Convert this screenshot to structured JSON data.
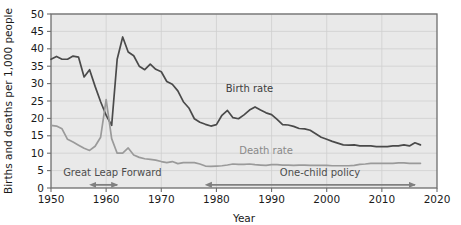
{
  "chart_data": {
    "type": "line",
    "title": "",
    "xlabel": "Year",
    "ylabel": "Births and deaths per 1,000 people",
    "xlim": [
      1950,
      2020
    ],
    "ylim": [
      0,
      50
    ],
    "xticks": [
      1950,
      1960,
      1970,
      1980,
      1990,
      2000,
      2010,
      2020
    ],
    "yticks": [
      0,
      5,
      10,
      15,
      20,
      25,
      30,
      35,
      40,
      45,
      50
    ],
    "grid": true,
    "legend_position": "inline-labels",
    "colors": {
      "birth_rate": "#4a4a4a",
      "death_rate": "#9a9a9a",
      "plot_background": "#e9e9e9",
      "grid": "#cfcfcf",
      "axis": "#6e6e6e",
      "annotation": "#808080"
    },
    "series": [
      {
        "name": "Birth rate",
        "color": "#4a4a4a",
        "label_x": 1986,
        "label_y": 27.5,
        "x": [
          1950,
          1951,
          1952,
          1953,
          1954,
          1955,
          1956,
          1957,
          1958,
          1959,
          1960,
          1961,
          1962,
          1963,
          1964,
          1965,
          1966,
          1967,
          1968,
          1969,
          1970,
          1971,
          1972,
          1973,
          1974,
          1975,
          1976,
          1977,
          1978,
          1979,
          1980,
          1981,
          1982,
          1983,
          1984,
          1985,
          1986,
          1987,
          1988,
          1989,
          1990,
          1991,
          1992,
          1993,
          1994,
          1995,
          1996,
          1997,
          1998,
          1999,
          2000,
          2001,
          2002,
          2003,
          2004,
          2005,
          2006,
          2007,
          2008,
          2009,
          2010,
          2011,
          2012,
          2013,
          2014,
          2015,
          2016,
          2017
        ],
        "values": [
          37.0,
          37.8,
          37.0,
          37.0,
          37.9,
          37.6,
          31.9,
          34.0,
          29.2,
          24.8,
          20.9,
          18.0,
          37.0,
          43.4,
          39.1,
          38.0,
          35.0,
          34.0,
          35.6,
          34.1,
          33.4,
          30.6,
          29.8,
          27.9,
          24.8,
          23.0,
          19.9,
          18.9,
          18.3,
          17.8,
          18.2,
          20.9,
          22.3,
          20.2,
          19.9,
          21.0,
          22.4,
          23.3,
          22.4,
          21.6,
          21.1,
          19.7,
          18.2,
          18.1,
          17.7,
          17.1,
          17.0,
          16.6,
          15.6,
          14.6,
          14.0,
          13.4,
          12.9,
          12.4,
          12.3,
          12.4,
          12.1,
          12.1,
          12.1,
          11.9,
          11.9,
          11.9,
          12.1,
          12.1,
          12.4,
          12.1,
          13.0,
          12.4
        ]
      },
      {
        "name": "Death rate",
        "color": "#9a9a9a",
        "label_x": 1989,
        "label_y": 9.8,
        "x": [
          1950,
          1951,
          1952,
          1953,
          1954,
          1955,
          1956,
          1957,
          1958,
          1959,
          1960,
          1961,
          1962,
          1963,
          1964,
          1965,
          1966,
          1967,
          1968,
          1969,
          1970,
          1971,
          1972,
          1973,
          1974,
          1975,
          1976,
          1977,
          1978,
          1979,
          1980,
          1981,
          1982,
          1983,
          1984,
          1985,
          1986,
          1987,
          1988,
          1989,
          1990,
          1991,
          1992,
          1993,
          1994,
          1995,
          1996,
          1997,
          1998,
          1999,
          2000,
          2001,
          2002,
          2003,
          2004,
          2005,
          2006,
          2007,
          2008,
          2009,
          2010,
          2011,
          2012,
          2013,
          2014,
          2015,
          2016,
          2017
        ],
        "values": [
          18.0,
          17.8,
          17.0,
          14.0,
          13.2,
          12.3,
          11.4,
          10.8,
          12.0,
          14.6,
          25.4,
          14.2,
          10.0,
          10.0,
          11.5,
          9.5,
          8.8,
          8.4,
          8.2,
          8.0,
          7.6,
          7.3,
          7.6,
          7.0,
          7.3,
          7.3,
          7.3,
          6.9,
          6.3,
          6.2,
          6.3,
          6.4,
          6.6,
          6.9,
          6.8,
          6.8,
          6.9,
          6.7,
          6.6,
          6.5,
          6.7,
          6.7,
          6.6,
          6.6,
          6.5,
          6.6,
          6.6,
          6.5,
          6.5,
          6.5,
          6.5,
          6.4,
          6.4,
          6.4,
          6.4,
          6.5,
          6.8,
          6.9,
          7.1,
          7.1,
          7.1,
          7.1,
          7.1,
          7.2,
          7.2,
          7.1,
          7.1,
          7.1
        ]
      }
    ],
    "annotations": [
      {
        "id": "great-leap-forward",
        "label": "Great Leap Forward",
        "label_x": 1952.2,
        "label_y": 3.4,
        "arrow_start": 1958,
        "arrow_end": 1962,
        "arrow_y": 0.9,
        "arrow_heads": "both"
      },
      {
        "id": "one-child-policy",
        "label": "One-child policy",
        "label_x": 1991.5,
        "label_y": 3.4,
        "arrow_start": 1979,
        "arrow_end": 2016,
        "arrow_y": 0.9,
        "arrow_heads": "both"
      }
    ]
  }
}
